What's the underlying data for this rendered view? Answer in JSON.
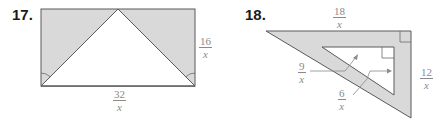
{
  "problems": [
    {
      "number": "17.",
      "labels": {
        "side_right": {
          "numerator": "16",
          "denominator": "x"
        },
        "side_bottom": {
          "numerator": "32",
          "denominator": "x"
        }
      },
      "description": "Rectangle with inscribed isosceles triangle; shaded regions outside triangle; equal angle marks at bottom corners"
    },
    {
      "number": "18.",
      "labels": {
        "outer_top": {
          "numerator": "18",
          "denominator": "x"
        },
        "outer_right": {
          "numerator": "12",
          "denominator": "x"
        },
        "inner_top": {
          "numerator": "9",
          "denominator": "x"
        },
        "inner_right": {
          "numerator": "6",
          "denominator": "x"
        }
      },
      "description": "Right triangle with smaller similar right triangle inside; shaded region between them; right-angle marks"
    }
  ],
  "colors": {
    "shade": "#d9d9d9",
    "stroke": "#555555",
    "label": "#8a8a8a"
  }
}
